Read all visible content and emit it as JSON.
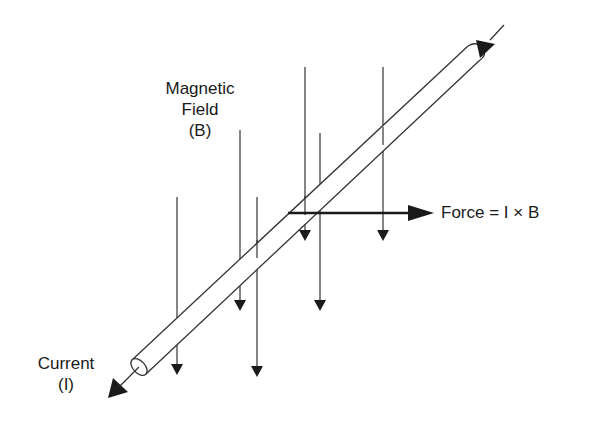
{
  "diagram": {
    "labels": {
      "field_line1": "Magnetic",
      "field_line2": "Field",
      "field_line3": "(B)",
      "current_line1": "Current",
      "current_line2": "(I)",
      "force": "Force = I × B"
    },
    "colors": {
      "ink": "#1a1a1a",
      "background": "#ffffff"
    },
    "field_lines": [
      {
        "x": 177,
        "y1": 197,
        "y2": 373
      },
      {
        "x": 240,
        "y1": 130,
        "y2": 310
      },
      {
        "x": 257,
        "y1": 197,
        "y2": 375
      },
      {
        "x": 305,
        "y1": 67,
        "y2": 240
      },
      {
        "x": 320,
        "y1": 133,
        "y2": 310
      },
      {
        "x": 383,
        "y1": 67,
        "y2": 240
      }
    ]
  }
}
